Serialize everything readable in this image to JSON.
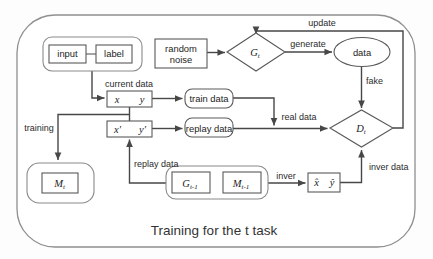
{
  "caption": "Training for the t task",
  "colors": {
    "line": "#474747",
    "shape_border": "#5a5a5a",
    "group_border": "#8a8a8a",
    "background": "#ffffff"
  },
  "nodes": {
    "input": "input",
    "label": "label",
    "random_noise": {
      "line1": "random",
      "line2": "noise"
    },
    "generator": {
      "base": "G",
      "sub": "t"
    },
    "data": "data",
    "discriminator": {
      "base": "D",
      "sub": "t"
    },
    "current_pair": {
      "x": "x",
      "y": "y"
    },
    "replay_pair": {
      "x": "x′",
      "y": "y′"
    },
    "train_data": "train data",
    "replay_data": "replay data",
    "memory": {
      "base": "M",
      "sub": "t"
    },
    "prev_generator": {
      "base": "G",
      "sub": "t-1"
    },
    "prev_memory": {
      "base": "M",
      "sub": "t-1"
    },
    "inver_pair": {
      "x": "x̂",
      "y": "ŷ"
    }
  },
  "edge_labels": {
    "update": "update",
    "generate": "generate",
    "fake": "fake",
    "current_data": "current data",
    "real_data": "real data",
    "training": "training",
    "replay_data": "replay data",
    "inver": "inver",
    "inver_data": "inver data"
  }
}
